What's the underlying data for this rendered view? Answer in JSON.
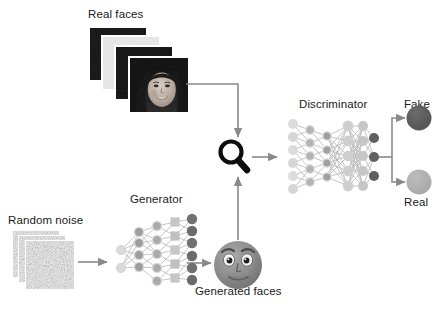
{
  "diagram": {
    "background": "#ffffff",
    "text_color": "#1a1a1a",
    "arrow_color": "#8a8a8a"
  },
  "labels": {
    "real_faces": "Real faces",
    "discriminator": "Discriminator",
    "fake": "Fake",
    "real": "Real",
    "generator": "Generator",
    "random_noise": "Random noise",
    "generated_faces": "Generated faces"
  },
  "icons": {
    "magnifier": "magnifying-glass-icon",
    "generated_face": "cartoon-face-icon",
    "photo_stack": "photo-stack-icon",
    "noise_stack": "noise-image-stack-icon"
  },
  "nodes": {
    "fake_circle_color": "#5c5c5c",
    "real_circle_color": "#b3b3b3"
  },
  "networks": {
    "generator": {
      "name": "generator-network",
      "layer_counts": [
        2,
        4,
        5,
        5,
        6
      ],
      "shapes": [
        "circle",
        "circle",
        "circle",
        "square",
        "circle"
      ],
      "layer_colors": [
        "#d5d5d5",
        "#9a9a9a",
        "#a8a8a8",
        "#c4c4c4",
        "#6f6f6f"
      ]
    },
    "discriminator": {
      "name": "discriminator-network",
      "layer_counts": [
        6,
        5,
        4,
        5,
        5,
        3
      ],
      "shapes": [
        "circle",
        "circle",
        "circle",
        "circle",
        "circle",
        "circle"
      ],
      "layer_colors": [
        "#d8d8d8",
        "#b9b9b9",
        "#a3a3a3",
        "#cfcfcf",
        "#c6c6c6",
        "#5f5f5f"
      ]
    }
  },
  "photo_stack": {
    "count": 4,
    "description": "grayscale portrait photographs of a smiling woman"
  },
  "noise_stack": {
    "count": 3,
    "description": "random static noise images"
  }
}
